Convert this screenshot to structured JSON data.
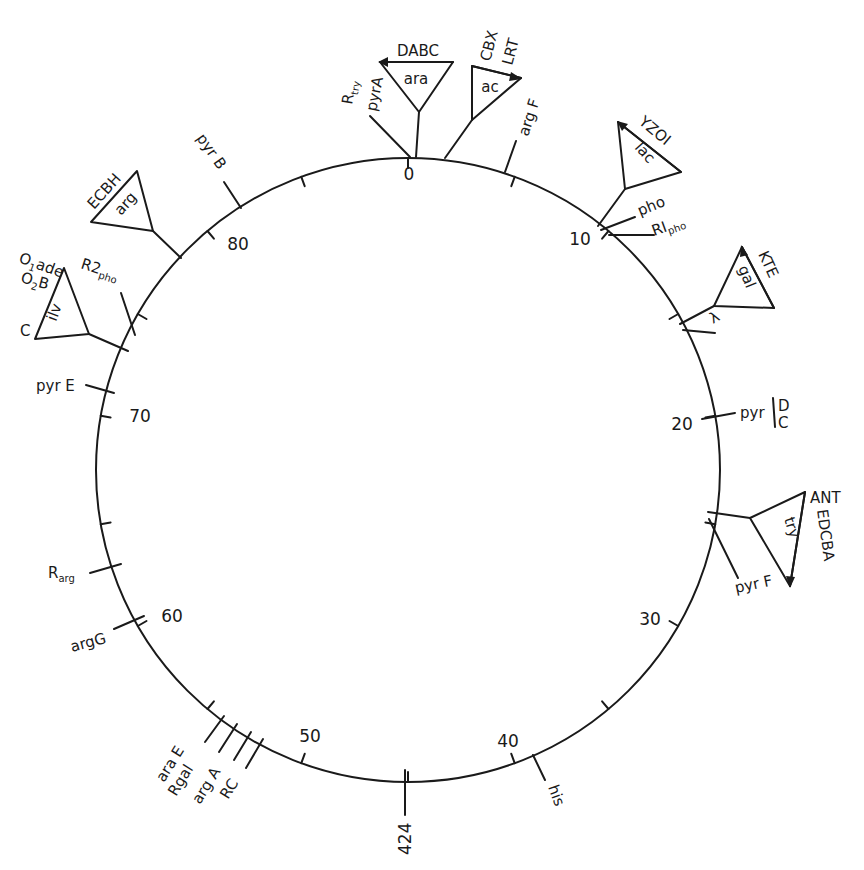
{
  "diagram": {
    "type": "circular genetic linkage map",
    "scale": {
      "min": 0,
      "max": 90,
      "unit": "minutes",
      "major_tick_every": 10,
      "minor_tick_every": 5
    },
    "scale_labels": [
      "0",
      "10",
      "20",
      "30",
      "40",
      "50",
      "60",
      "70",
      "80"
    ],
    "marker_424": "424",
    "colors": {
      "ink": "#1a1a1a",
      "background": "#ffffff"
    },
    "loci": {
      "r_try": "R",
      "r_try_sub": "try",
      "pyrA": "pyrA",
      "ara_operon": "ara",
      "ara_genes": "DABC",
      "ac_operon": "ac",
      "ac_genes_top": "CBX",
      "ac_genes_bottom": "LRT",
      "argF": "arg F",
      "lac_operon": "lac",
      "lac_genes": "YZOI",
      "pho": "pho",
      "r1_pho": "RI",
      "r1_pho_sub": "pho",
      "gal_operon": "gal",
      "gal_genes": "KTE",
      "lambda": "λ",
      "pyr_dc": "pyr",
      "pyr_dc_top": "D",
      "pyr_dc_bottom": "C",
      "try_operon": "try",
      "try_genes_top": "ANT",
      "try_genes_side": "EDCBA",
      "pyrF": "pyr F",
      "his": "his",
      "araE": "ara E",
      "rgal": "Rgal",
      "argA": "arg A",
      "rc": "RC",
      "argG": "argG",
      "r_arg": "R",
      "r_arg_sub": "arg",
      "pyrE": "pyr E",
      "ilv_operon": "ilv",
      "ilv_o1ade": "O",
      "ilv_o1ade_sub": "1",
      "ilv_o1ade_rest": "ade",
      "ilv_o2b": "O",
      "ilv_o2b_sub": "2",
      "ilv_o2b_rest": "B",
      "ilv_c": "C",
      "r2_pho": "R2",
      "r2_pho_sub": "pho",
      "arg_operon": "arg",
      "arg_genes": "ECBH",
      "pyrB": "pyr B"
    }
  }
}
